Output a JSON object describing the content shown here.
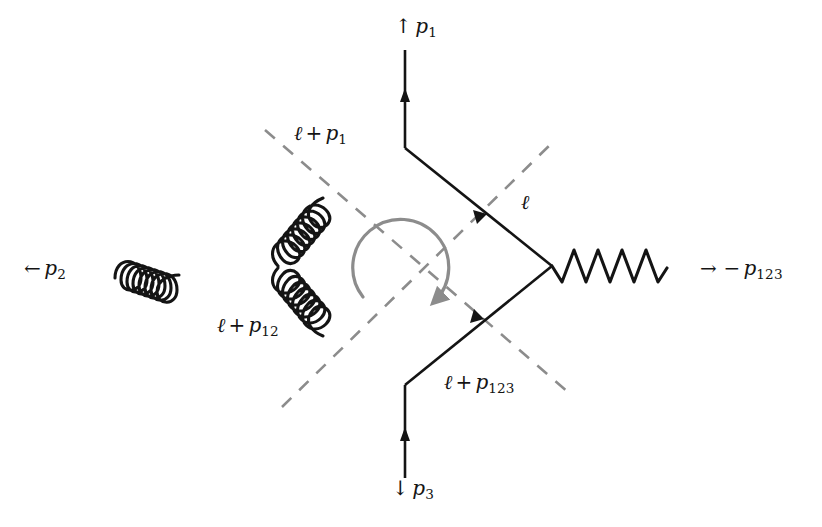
{
  "figure": {
    "kind": "feynman-diagram",
    "width": 822,
    "height": 527,
    "background_color": "#ffffff",
    "line_color": "#141414",
    "cut_color": "#8c8c8c",
    "orientation_arrow_color": "#8c8c8c"
  },
  "external_legs": [
    {
      "id": "p1",
      "position": "top",
      "label_arrow": "↑",
      "label_symbol": "p",
      "label_subscript": "1",
      "label_text": "↑ p1",
      "propagator_type": "fermion",
      "arrow_direction": "up"
    },
    {
      "id": "p2",
      "position": "left",
      "label_arrow": "←",
      "label_symbol": "p",
      "label_subscript": "2",
      "label_text": "← p2",
      "propagator_type": "gluon",
      "coil_count": 7
    },
    {
      "id": "p3",
      "position": "bottom",
      "label_arrow": "↓",
      "label_symbol": "p",
      "label_subscript": "3",
      "label_text": "↓ p3",
      "propagator_type": "fermion",
      "arrow_direction": "up"
    },
    {
      "id": "p123",
      "position": "right",
      "label_arrow": "→",
      "label_sign": "−",
      "label_symbol": "p",
      "label_subscript": "123",
      "label_text": "→ −p123",
      "propagator_type": "photon",
      "wave_count": 5
    }
  ],
  "loop_momenta": [
    {
      "id": "l-plus-p1",
      "edge": "upper-left",
      "symbol": "ℓ",
      "operator": "+",
      "term_symbol": "p",
      "term_subscript": "1",
      "text": "ℓ + p1",
      "propagator_type": "gluon"
    },
    {
      "id": "l",
      "edge": "upper-right",
      "symbol": "ℓ",
      "operator": "",
      "term_symbol": "",
      "term_subscript": "",
      "text": "ℓ",
      "propagator_type": "fermion"
    },
    {
      "id": "l-plus-p12",
      "edge": "lower-left",
      "symbol": "ℓ",
      "operator": "+",
      "term_symbol": "p",
      "term_subscript": "12",
      "text": "ℓ + p12",
      "propagator_type": "gluon"
    },
    {
      "id": "l-plus-p123",
      "edge": "lower-right",
      "symbol": "ℓ",
      "operator": "+",
      "term_symbol": "p",
      "term_subscript": "123",
      "text": "ℓ + p123",
      "propagator_type": "fermion"
    }
  ],
  "cuts": [
    {
      "id": "cut-nw-se",
      "style": "dashed",
      "from": "top-left",
      "to": "bottom-right"
    },
    {
      "id": "cut-sw-ne",
      "style": "dashed",
      "from": "bottom-left",
      "to": "top-right"
    }
  ],
  "orientation_arrow": {
    "id": "loop-orientation",
    "direction": "counterclockwise",
    "style": "curved-arrow",
    "color": "#8c8c8c"
  },
  "vertices": [
    {
      "id": "top",
      "x": 405,
      "y": 148
    },
    {
      "id": "right",
      "x": 552,
      "y": 266
    },
    {
      "id": "bottom",
      "x": 405,
      "y": 385
    },
    {
      "id": "left",
      "x": 277,
      "y": 267
    }
  ]
}
